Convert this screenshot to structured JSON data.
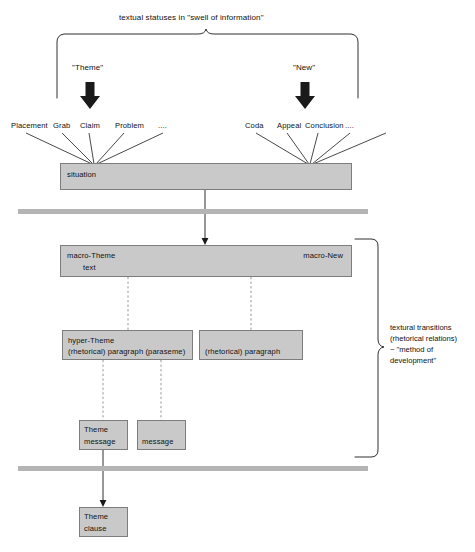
{
  "diagram": {
    "top_caption": "textual statuses in \"swell of information\"",
    "stratum_arrows": [
      {
        "label": "\"Theme\"",
        "x": 90
      },
      {
        "label": "\"New\"",
        "x": 305
      }
    ],
    "theme_statuses": [
      "Placement",
      "Grab",
      "Claim",
      "Problem",
      "...."
    ],
    "new_statuses": [
      "Coda",
      "Appeal",
      "Conclusion",
      "...."
    ],
    "boxes": {
      "situation": {
        "label": "situation"
      },
      "macro": {
        "theme_label": "macro-Theme",
        "text_label": "text",
        "new_label": "macro-New"
      },
      "hyper_theme": {
        "line1": "hyper-Theme",
        "line2": "(rhetorical) paragraph (paraseme)"
      },
      "paragraph": {
        "label": "(rhetorical) paragraph"
      },
      "theme_message": {
        "line1": "Theme",
        "line2": "message"
      },
      "message": {
        "label": "message"
      },
      "theme_clause": {
        "line1": "Theme",
        "line2": "clause"
      }
    },
    "right_annotation": {
      "line1": "textural transitions",
      "line2": "(rhetorical relations)",
      "line3": "~ \"method of",
      "line4": "development\""
    },
    "colors": {
      "box_fill": "#c9c9c9",
      "box_border": "#7d7d7d",
      "separator_bar": "#b4b4b4",
      "stroke": "#1a1a1a",
      "text": "#111111",
      "background": "#ffffff"
    }
  }
}
